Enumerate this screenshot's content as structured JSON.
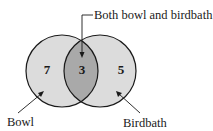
{
  "diagram": {
    "type": "venn",
    "sets": [
      {
        "name": "Bowl",
        "only_count": "7"
      },
      {
        "name": "Birdbath",
        "only_count": "5"
      }
    ],
    "intersection": {
      "label": "Both bowl and birdbath",
      "count": "3"
    },
    "labels": {
      "left": "Bowl",
      "right": "Birdbath",
      "top": "Both bowl and birdbath"
    },
    "counts": {
      "left_only": "7",
      "both": "3",
      "right_only": "5"
    },
    "colors": {
      "circle_fill": "#dcdcdc",
      "intersection_fill": "#a9a9a9",
      "stroke": "#1a1a1a"
    }
  }
}
